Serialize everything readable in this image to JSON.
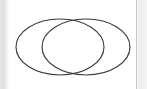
{
  "page": {
    "background_color": "#ffffff",
    "width": 147,
    "height": 89
  },
  "gutters": {
    "left": {
      "label": "left page shadow strip",
      "color": "#dcdcdc",
      "width": 9
    },
    "right": {
      "label": "right page edge rule",
      "color": "#c9c9c9",
      "width": 10
    }
  },
  "figure": {
    "name": "venn-diagram",
    "type": "two-set-venn",
    "caption": "",
    "stroke_color": "#3a3a3f",
    "fill_color": "none",
    "stroke_width": 1.15,
    "shapes": [
      {
        "name": "left-set-ellipse",
        "shape": "ellipse",
        "cx": 51,
        "cy": 47,
        "rx": 44,
        "ry": 28,
        "label": ""
      },
      {
        "name": "right-set-ellipse",
        "shape": "ellipse",
        "cx": 77,
        "cy": 47,
        "rx": 44,
        "ry": 28,
        "label": ""
      }
    ],
    "regions": {
      "left_only_label": "",
      "intersection_label": "",
      "right_only_label": ""
    }
  }
}
